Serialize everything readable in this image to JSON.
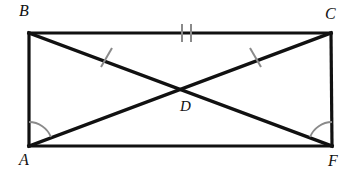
{
  "figure": {
    "stroke_color": "#111111",
    "mark_color": "#8a8a8a",
    "background_color": "#ffffff",
    "vertices": [
      {
        "name": "B",
        "label": "B",
        "x": 29,
        "y": 33
      },
      {
        "name": "C",
        "label": "C",
        "x": 331,
        "y": 33
      },
      {
        "name": "A",
        "label": "A",
        "x": 29,
        "y": 146
      },
      {
        "name": "F",
        "label": "F",
        "x": 332,
        "y": 146
      },
      {
        "name": "D",
        "label": "D",
        "x": 184,
        "y": 96
      }
    ],
    "segments": [
      {
        "name": "side-BC",
        "from": "B",
        "to": "C",
        "ticks": 2
      },
      {
        "name": "side-AB",
        "from": "A",
        "to": "B",
        "ticks": 0
      },
      {
        "name": "side-CF",
        "from": "C",
        "to": "F",
        "ticks": 0
      },
      {
        "name": "side-AF",
        "from": "A",
        "to": "F",
        "ticks": 0
      },
      {
        "name": "diagonal-BF",
        "from": "B",
        "to": "F",
        "ticks": 0
      },
      {
        "name": "diagonal-AC",
        "from": "A",
        "to": "C",
        "ticks": 0
      },
      {
        "name": "segment-BD",
        "from": "B",
        "to": "D",
        "ticks": 1
      },
      {
        "name": "segment-DC",
        "from": "D",
        "to": "C",
        "ticks": 1
      }
    ],
    "angle_marks": [
      {
        "name": "angle-A",
        "vertex": "A",
        "arcs": 1
      },
      {
        "name": "angle-F",
        "vertex": "F",
        "arcs": 1
      }
    ]
  }
}
